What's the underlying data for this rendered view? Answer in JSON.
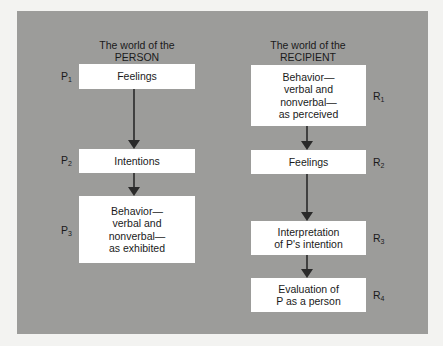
{
  "person": {
    "heading_line1": "The world of the",
    "heading_line2": "PERSON",
    "steps": [
      {
        "label": "P",
        "index": "1",
        "text": "Feelings"
      },
      {
        "label": "P",
        "index": "2",
        "text": "Intentions"
      },
      {
        "label": "P",
        "index": "3",
        "text": "Behavior—\nverbal and\nnonverbal—\nas exhibited"
      }
    ]
  },
  "recipient": {
    "heading_line1": "The world of the",
    "heading_line2": "RECIPIENT",
    "steps": [
      {
        "label": "R",
        "index": "1",
        "text": "Behavior—\nverbal and\nnonverbal—\nas perceived"
      },
      {
        "label": "R",
        "index": "2",
        "text": "Feelings"
      },
      {
        "label": "R",
        "index": "3",
        "text": "Interpretation\nof P's intention"
      },
      {
        "label": "R",
        "index": "4",
        "text": "Evaluation of\nP as a person"
      }
    ]
  }
}
